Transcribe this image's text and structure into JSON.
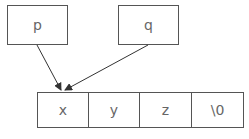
{
  "pointers": [
    {
      "label": "p"
    },
    {
      "label": "q"
    }
  ],
  "array": {
    "cells": [
      "x",
      "y",
      "z",
      "\\0"
    ]
  },
  "colors": {
    "stroke": "#555555",
    "text": "#666666",
    "arrow": "#333333"
  }
}
